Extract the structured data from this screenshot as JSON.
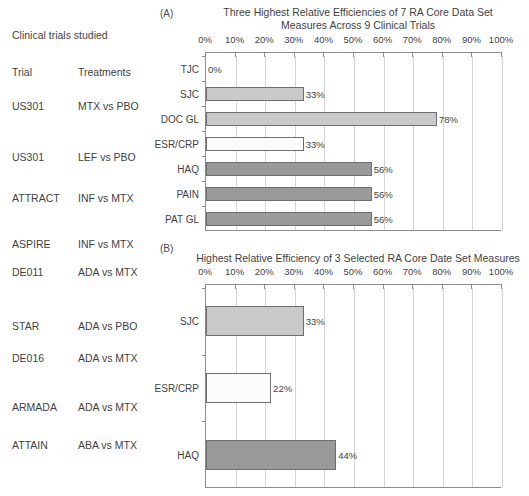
{
  "table": {
    "caption": "Clinical trials studied",
    "columns": [
      "Trial",
      "Treatments"
    ],
    "rows": [
      {
        "trial": "US301",
        "treatments": "MTX vs PBO"
      },
      {
        "trial": "US301",
        "treatments": "LEF vs PBO"
      },
      {
        "trial": "ATTRACT",
        "treatments": "INF vs MTX"
      },
      {
        "trial": "ASPIRE",
        "treatments": "INF vs MTX"
      },
      {
        "trial": "DE011",
        "treatments": "ADA vs MTX"
      },
      {
        "trial": "STAR",
        "treatments": "ADA vs PBO"
      },
      {
        "trial": "DE016",
        "treatments": "ADA vs MTX"
      },
      {
        "trial": "ARMADA",
        "treatments": "ADA vs MTX"
      },
      {
        "trial": "ATTAIN",
        "treatments": "ABA vs MTX"
      }
    ]
  },
  "panels": {
    "a_tag": "(A)",
    "b_tag": "(B)"
  },
  "colors": {
    "bar_light": "#c9c9c9",
    "bar_white": "#fbfbfb",
    "bar_dark": "#9a9a9a",
    "bar_outline": "#6e6e6e",
    "axis": "#8b8b8b",
    "grid": "#d4d4d4",
    "text": "#3f3f3f"
  },
  "chart_data": [
    {
      "type": "bar",
      "orientation": "horizontal",
      "panel": "(A)",
      "title": "Three Highest Relative Efficiencies of 7 RA Core Data Set Measures Across 9 Clinical Trials",
      "title_lines": [
        "Three Highest Relative Efficiencies of 7 RA Core Data Set",
        "Measures Across 9 Clinical Trials"
      ],
      "xlabel": "",
      "ylabel": "",
      "xlim": [
        0,
        100
      ],
      "xticks": [
        0,
        10,
        20,
        30,
        40,
        50,
        60,
        70,
        80,
        90,
        100
      ],
      "xticklabels": [
        "0%",
        "10%",
        "20%",
        "30%",
        "40%",
        "50%",
        "60%",
        "70%",
        "80%",
        "90%",
        "100%"
      ],
      "grid": true,
      "legend": "none",
      "categories": [
        "TJC",
        "SJC",
        "DOC GL",
        "ESR/CRP",
        "HAQ",
        "PAIN",
        "PAT GL"
      ],
      "values": [
        0,
        33,
        78,
        33,
        56,
        56,
        56
      ],
      "data_labels": [
        "0%",
        "33%",
        "78%",
        "33%",
        "56%",
        "56%",
        "56%"
      ],
      "fills": [
        "none",
        "light",
        "light",
        "white",
        "dark",
        "dark",
        "dark"
      ]
    },
    {
      "type": "bar",
      "orientation": "horizontal",
      "panel": "(B)",
      "title": "Highest Relative Efficiency of 3 Selected RA Core Date Set Measures",
      "title_lines": [
        "Highest Relative Efficiency of 3 Selected RA Core Date Set Measures"
      ],
      "xlabel": "",
      "ylabel": "",
      "xlim": [
        0,
        100
      ],
      "xticks": [
        0,
        10,
        20,
        30,
        40,
        50,
        60,
        70,
        80,
        90,
        100
      ],
      "xticklabels": [
        "0%",
        "10%",
        "20%",
        "30%",
        "40%",
        "50%",
        "60%",
        "70%",
        "80%",
        "90%",
        "100%"
      ],
      "grid": true,
      "legend": "none",
      "categories": [
        "SJC",
        "ESR/CRP",
        "HAQ"
      ],
      "values": [
        33,
        22,
        44
      ],
      "data_labels": [
        "33%",
        "22%",
        "44%"
      ],
      "fills": [
        "light",
        "white",
        "dark"
      ]
    }
  ]
}
